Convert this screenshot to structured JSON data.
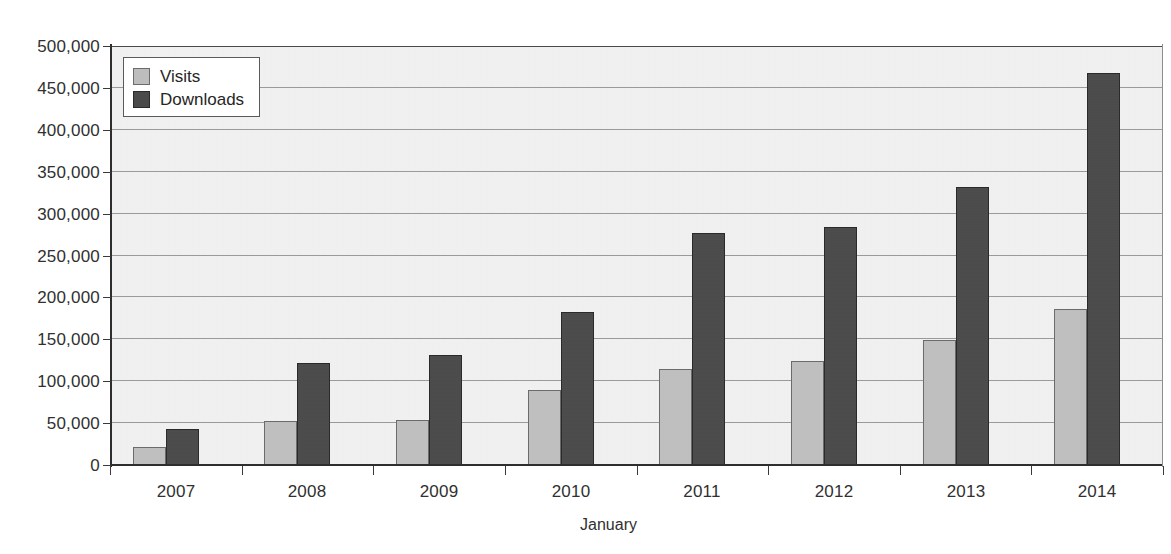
{
  "chart_data": {
    "type": "bar",
    "title": "",
    "xlabel": "January",
    "ylabel": "",
    "categories": [
      "2007",
      "2008",
      "2009",
      "2010",
      "2011",
      "2012",
      "2013",
      "2014"
    ],
    "series": [
      {
        "name": "Visits",
        "color": "#bdbdbd",
        "values": [
          22000,
          52000,
          54000,
          90000,
          115000,
          124000,
          149000,
          186000
        ]
      },
      {
        "name": "Downloads",
        "color": "#4a4a4a",
        "values": [
          43000,
          122000,
          131000,
          183000,
          277000,
          284000,
          332000,
          468000
        ]
      }
    ],
    "ylim": [
      0,
      500000
    ],
    "ytick_step": 50000,
    "ytick_labels": [
      "0",
      "50,000",
      "100,000",
      "150,000",
      "200,000",
      "250,000",
      "300,000",
      "350,000",
      "400,000",
      "450,000",
      "500,000"
    ],
    "grid": true,
    "grid_axis": "y",
    "legend_position": "top-left",
    "plot_background": "#f2f2f2",
    "axis_color": "#2e2e2e",
    "gridline_color": "#9a9a9a"
  },
  "legend": {
    "items": [
      {
        "label": "Visits"
      },
      {
        "label": "Downloads"
      }
    ]
  },
  "axis": {
    "x_title": "January"
  }
}
